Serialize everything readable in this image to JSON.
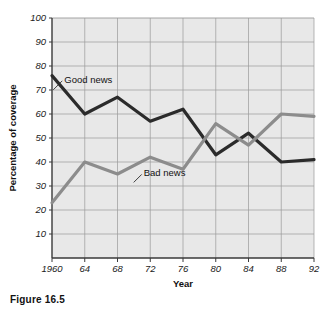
{
  "figure": {
    "caption": "Figure 16.5"
  },
  "chart_data": {
    "type": "line",
    "title": "",
    "xlabel": "Year",
    "ylabel": "Percentage of coverage",
    "x": [
      1960,
      1964,
      1968,
      1972,
      1976,
      1980,
      1984,
      1988,
      1992
    ],
    "xtick_labels": [
      "1960",
      "64",
      "68",
      "72",
      "76",
      "80",
      "84",
      "88",
      "92"
    ],
    "xlim": [
      1960,
      1992
    ],
    "ylim": [
      0,
      100
    ],
    "ytick_labels": [
      "10",
      "20",
      "30",
      "40",
      "50",
      "60",
      "70",
      "80",
      "90",
      "100"
    ],
    "yticks": [
      10,
      20,
      30,
      40,
      50,
      60,
      70,
      80,
      90,
      100
    ],
    "grid": true,
    "legend_position": "inline-annotations",
    "series": [
      {
        "name": "Good news",
        "color": "#2b2b2b",
        "values": [
          76,
          60,
          67,
          57,
          62,
          43,
          52,
          40,
          41
        ],
        "annotation": {
          "text": "Good news",
          "x": 1961.5,
          "y": 73
        }
      },
      {
        "name": "Bad news",
        "color": "#8c8c8c",
        "values": [
          23,
          40,
          35,
          42,
          37,
          56,
          47,
          60,
          59
        ],
        "annotation": {
          "text": "Bad news",
          "x": 1971.2,
          "y": 34
        }
      }
    ]
  }
}
